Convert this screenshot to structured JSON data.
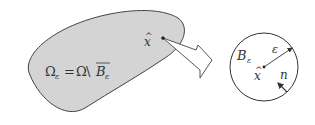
{
  "diagram": {
    "domain_label": {
      "omega": "Ω",
      "sub_eps": "ε",
      "equals": "=",
      "omega2": "Ω",
      "setminus": "\\",
      "ball": "B",
      "ball_sub": "ε"
    },
    "point_label": "x",
    "point_hat": "^",
    "ball_label": "B",
    "ball_label_sub": "ε",
    "radius_label": "ε",
    "center_label": "x",
    "center_hat": "^",
    "normal_label": "n",
    "colors": {
      "domain_fill": "#d4d4d4",
      "stroke": "#444444",
      "background": "#ffffff"
    }
  }
}
